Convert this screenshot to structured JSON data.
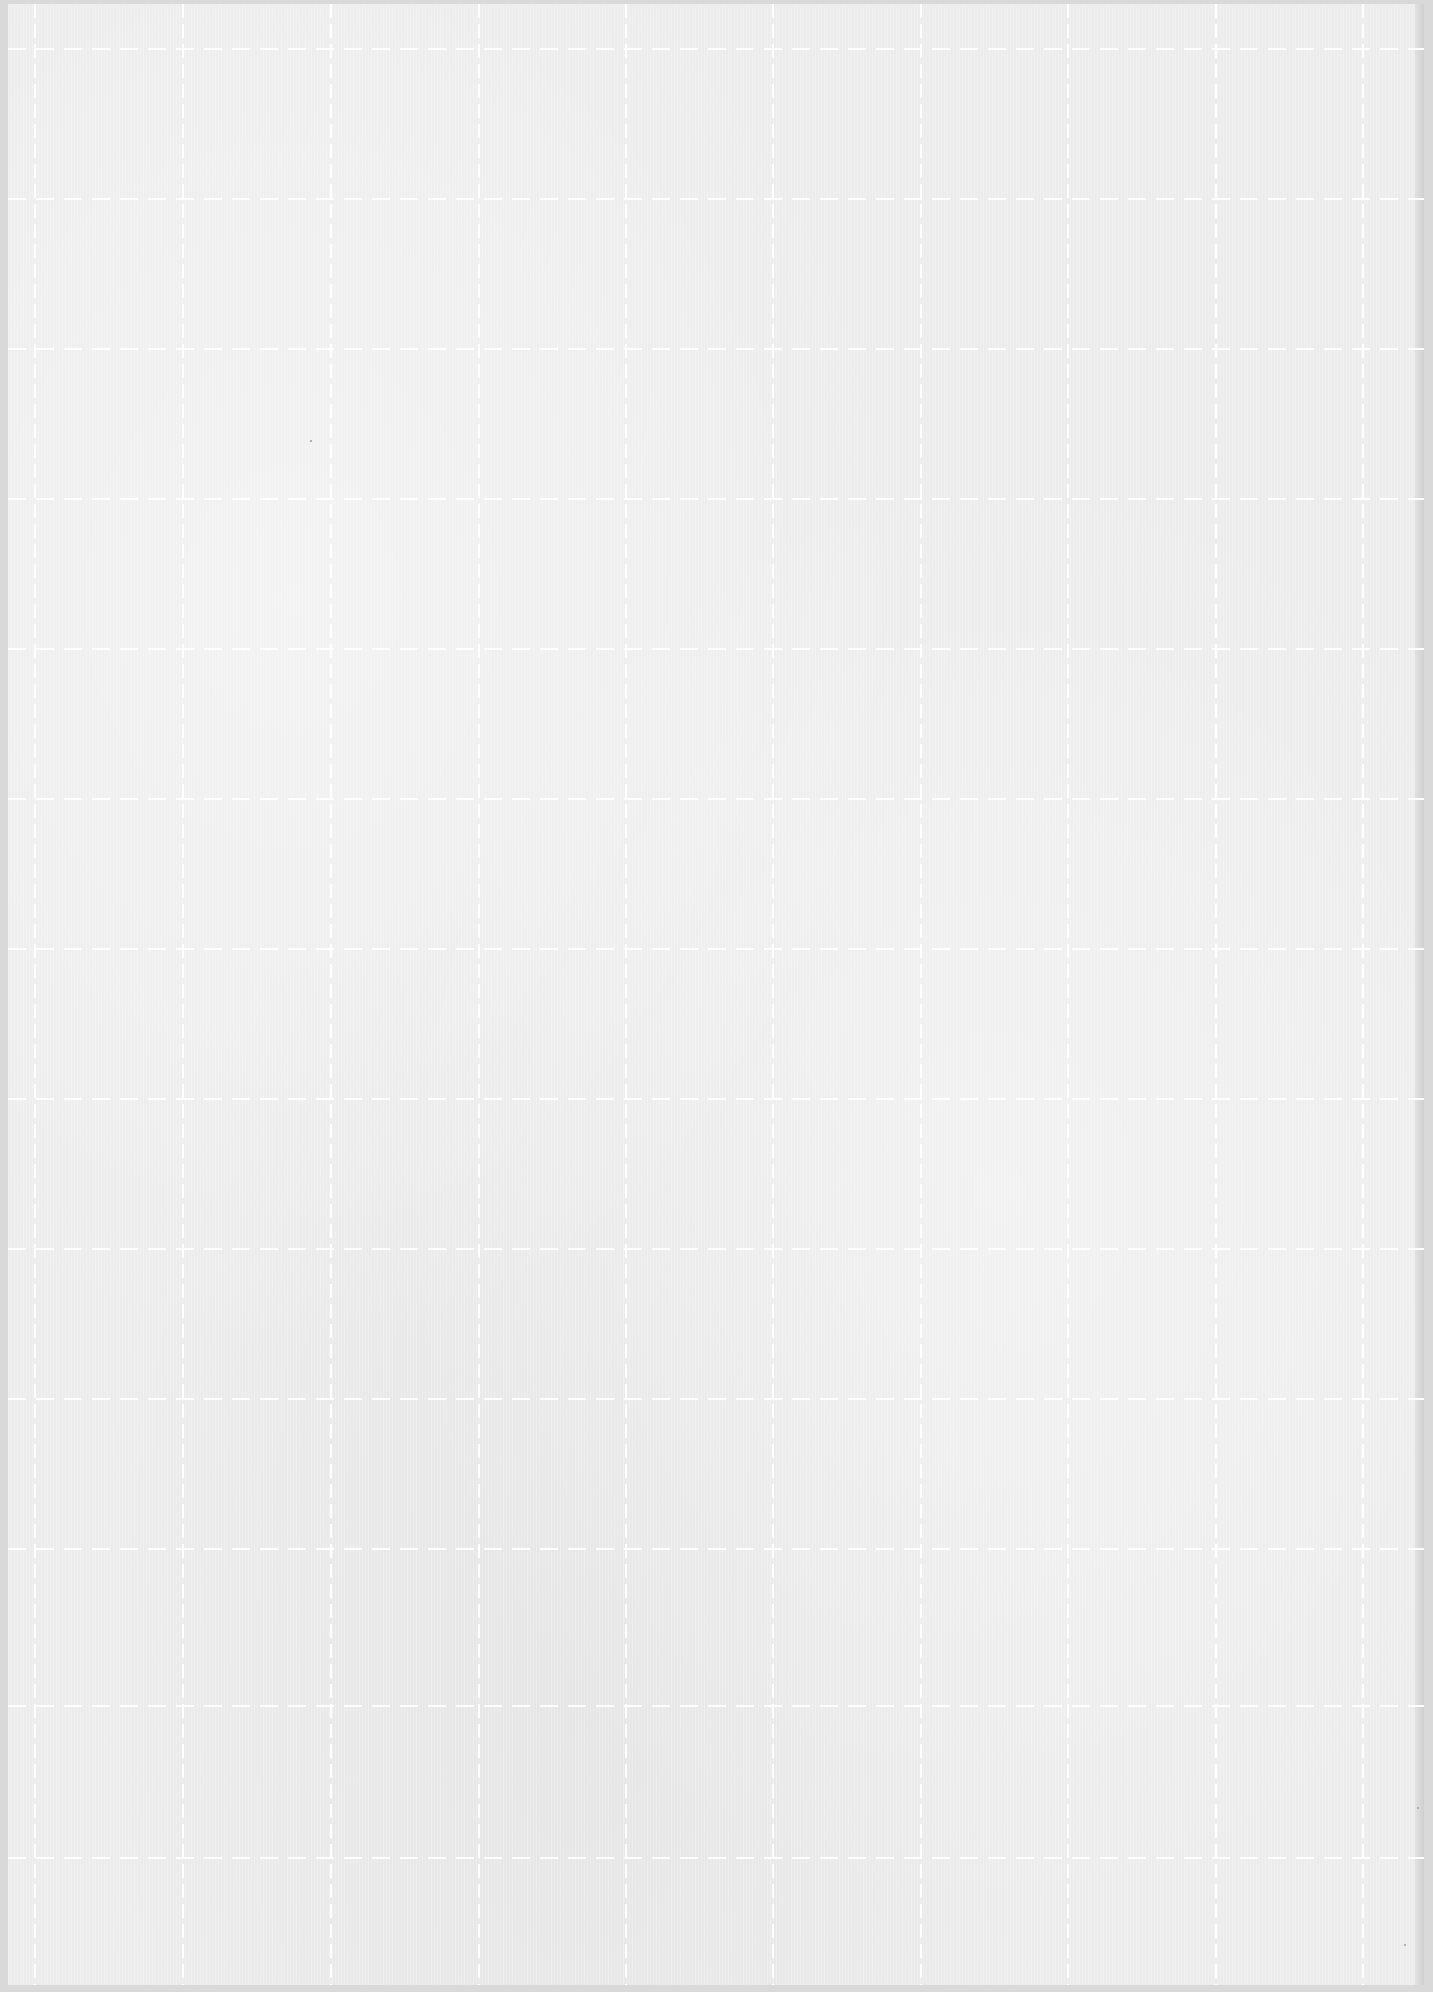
{
  "sheet": {
    "kind": "textured paper with dashed grid",
    "background_color": "#ececec",
    "border_color": "#d9d9d9",
    "grid_line_color": "#ffffff",
    "grid_line_style": "dashed"
  },
  "grid": {
    "vertical_x": [
      34,
      182,
      330,
      478,
      625,
      772,
      920,
      1067,
      1215,
      1362
    ],
    "horizontal_y": [
      48,
      198,
      348,
      498,
      648,
      798,
      948,
      1098,
      1248,
      1398,
      1548,
      1705,
      1857
    ]
  },
  "specks": [
    {
      "x": 1417,
      "y": 1807
    },
    {
      "x": 1404,
      "y": 1944
    },
    {
      "x": 310,
      "y": 440
    }
  ]
}
